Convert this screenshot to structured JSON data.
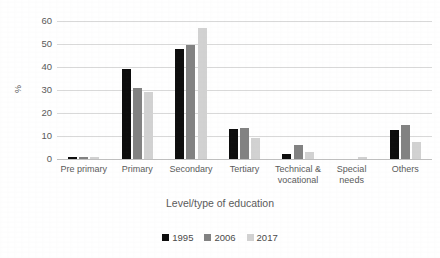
{
  "chart_data": {
    "type": "bar",
    "title": "",
    "xlabel": "Level/type of education",
    "ylabel": "%",
    "ylim": [
      0,
      60
    ],
    "yticks": [
      0,
      10,
      20,
      30,
      40,
      50,
      60
    ],
    "grid": "horizontal",
    "legend_position": "bottom",
    "categories": [
      "Pre primary",
      "Primary",
      "Secondary",
      "Tertiary",
      "Technical & vocational",
      "Special needs",
      "Others"
    ],
    "category_lines": [
      [
        "Pre primary"
      ],
      [
        "Primary"
      ],
      [
        "Secondary"
      ],
      [
        "Tertiary"
      ],
      [
        "Technical &",
        "vocational"
      ],
      [
        "Special",
        "needs"
      ],
      [
        "Others"
      ]
    ],
    "series": [
      {
        "name": "1995",
        "color": "#0d0d0d",
        "values": [
          1,
          39,
          48,
          13,
          2,
          0,
          12.5
        ]
      },
      {
        "name": "2006",
        "color": "#828282",
        "values": [
          1,
          31,
          49.5,
          13.5,
          6,
          0,
          15
        ]
      },
      {
        "name": "2017",
        "color": "#d2d2d2",
        "values": [
          1,
          29,
          57,
          9,
          3,
          1,
          7.5
        ]
      }
    ]
  },
  "legend": {
    "items": [
      {
        "label": "1995"
      },
      {
        "label": "2006"
      },
      {
        "label": "2017"
      }
    ]
  }
}
